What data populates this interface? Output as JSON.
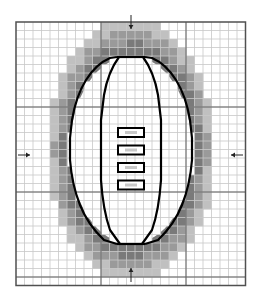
{
  "diagram": {
    "grid": {
      "left": 16,
      "top": 22,
      "cell": 8.5,
      "cols": 27,
      "rows": 31,
      "major_every": 10,
      "minor_color": "#c8c8c8",
      "major_color": "#606060",
      "border_color": "#505050"
    },
    "shading": {
      "dark": "#7a7a7a",
      "mid": "#9a9a9a",
      "light": "#c0c0c0"
    },
    "arrows": [
      {
        "name": "arrow-top",
        "direction": "down"
      },
      {
        "name": "arrow-bottom",
        "direction": "up"
      },
      {
        "name": "arrow-left",
        "direction": "right"
      },
      {
        "name": "arrow-right",
        "direction": "left"
      }
    ],
    "ball": {
      "outline_color": "#000000",
      "laces_count": 4
    }
  }
}
